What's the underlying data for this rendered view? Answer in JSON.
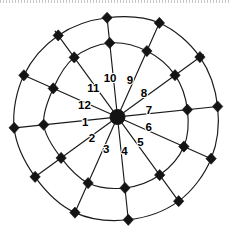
{
  "figure": {
    "center": {
      "x": 117.5,
      "y": 117.0
    },
    "hub_radius": 7.5,
    "background_color": "#ffffff",
    "line_color": "#1a1a1a",
    "marker_color": "#141414",
    "label_color": "#000000"
  },
  "rings": [
    {
      "name": "inner-ring",
      "radius": 72,
      "wobble": 2.6
    },
    {
      "name": "outer-ring",
      "radius": 103,
      "wobble": 3.2
    }
  ],
  "spokes": [
    {
      "index": 1,
      "label": "1",
      "angle_deg": 186,
      "label_angle_deg": 191,
      "label_radius": 33
    },
    {
      "index": 2,
      "label": "2",
      "angle_deg": 216,
      "label_angle_deg": 221,
      "label_radius": 34
    },
    {
      "index": 3,
      "label": "3",
      "angle_deg": 246,
      "label_angle_deg": 251,
      "label_radius": 35
    },
    {
      "index": 4,
      "label": "4",
      "angle_deg": 276,
      "label_angle_deg": 281,
      "label_radius": 36
    },
    {
      "index": 5,
      "label": "5",
      "angle_deg": 306,
      "label_angle_deg": 311,
      "label_radius": 35
    },
    {
      "index": 6,
      "label": "6",
      "angle_deg": 336,
      "label_angle_deg": 341,
      "label_radius": 33
    },
    {
      "index": 7,
      "label": "7",
      "angle_deg": 6,
      "label_angle_deg": 11,
      "label_radius": 32
    },
    {
      "index": 8,
      "label": "8",
      "angle_deg": 36,
      "label_angle_deg": 41,
      "label_radius": 35
    },
    {
      "index": 9,
      "label": "9",
      "angle_deg": 66,
      "label_angle_deg": 71,
      "label_radius": 38
    },
    {
      "index": 10,
      "label": "10",
      "angle_deg": 96,
      "label_angle_deg": 101,
      "label_radius": 39
    },
    {
      "index": 11,
      "label": "11",
      "angle_deg": 126,
      "label_angle_deg": 131,
      "label_radius": 37
    },
    {
      "index": 12,
      "label": "12",
      "angle_deg": 156,
      "label_angle_deg": 161,
      "label_radius": 35
    }
  ],
  "node_markers": {
    "shape": "diamond",
    "half_width": 5.2,
    "half_height": 5.6,
    "count": 24,
    "description": "filled black diamond at every spoke-ring intersection"
  },
  "chart_data": {
    "type": "scatter",
    "title": "",
    "xlabel": "",
    "ylabel": "",
    "coordinate_system": "polar",
    "categories": [
      "1",
      "2",
      "3",
      "4",
      "5",
      "6",
      "7",
      "8",
      "9",
      "10",
      "11",
      "12"
    ],
    "radial_levels": [
      72,
      103
    ],
    "series": [
      {
        "name": "inner-ring",
        "values": [
          72,
          72,
          72,
          72,
          72,
          72,
          72,
          72,
          72,
          72,
          72,
          72
        ]
      },
      {
        "name": "outer-ring",
        "values": [
          103,
          103,
          103,
          103,
          103,
          103,
          103,
          103,
          103,
          103,
          103,
          103
        ]
      }
    ],
    "legend_position": "none",
    "grid": true
  }
}
